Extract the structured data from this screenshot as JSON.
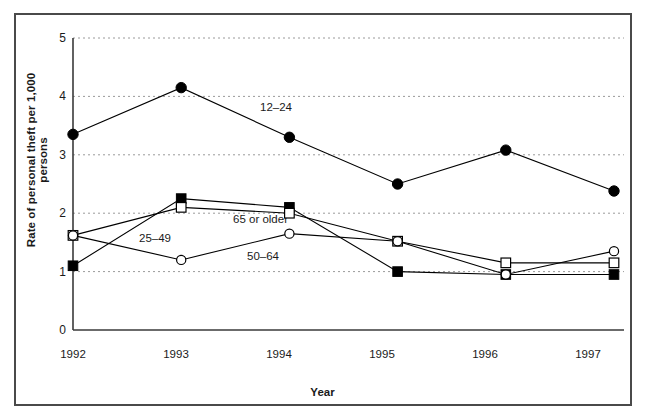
{
  "chart_data": {
    "type": "line",
    "title": "",
    "xlabel": "Year",
    "ylabel": "Rate of personal theft per 1,000 persons",
    "categories": [
      "1992",
      "1993",
      "1994",
      "1995",
      "1996",
      "1997"
    ],
    "x": [
      1992,
      1993,
      1994,
      1995,
      1996,
      1997
    ],
    "ylim": [
      0,
      5
    ],
    "yticks": [
      "0",
      "1",
      "2",
      "3",
      "4",
      "5"
    ],
    "ytick_values": [
      0,
      1,
      2,
      3,
      4,
      5
    ],
    "grid": "horizontal-dashed",
    "legend_position": "inline-annotations",
    "series": [
      {
        "name": "12-24",
        "label": "12–24",
        "marker": "filled-circle",
        "color": "#000000",
        "values": [
          3.35,
          4.15,
          3.3,
          2.5,
          3.08,
          2.38
        ]
      },
      {
        "name": "65 or older",
        "label": "65 or older",
        "marker": "filled-square",
        "color": "#000000",
        "values": [
          1.1,
          2.25,
          2.1,
          1.0,
          0.95,
          0.95
        ]
      },
      {
        "name": "25-49",
        "label": "25–49",
        "marker": "open-square",
        "color": "#000000",
        "values": [
          1.62,
          2.1,
          2.0,
          1.52,
          1.15,
          1.15
        ]
      },
      {
        "name": "50-64",
        "label": "50–64",
        "marker": "open-circle",
        "color": "#000000",
        "values": [
          1.62,
          1.2,
          1.65,
          1.52,
          0.95,
          1.35
        ]
      }
    ],
    "annotations": [
      {
        "text": "12–24",
        "x": 1993.55,
        "y": 3.78
      },
      {
        "text": "65 or older",
        "x": 1993.52,
        "y": 2.35
      },
      {
        "text": "25–49",
        "x": 1992.72,
        "y": 1.62
      },
      {
        "text": "50–64",
        "x": 1993.78,
        "y": 1.32
      }
    ]
  }
}
